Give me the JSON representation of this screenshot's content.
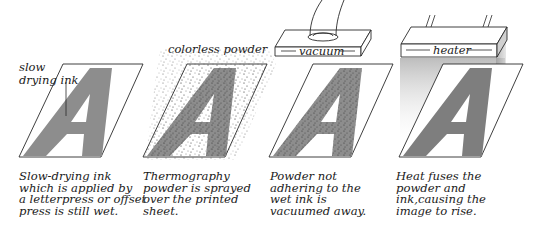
{
  "colors": {
    "ink": "#8d8d8d",
    "line": "#2a2a2a",
    "background": "#ffffff",
    "heat_glow": "#c8c8c8",
    "powder_dot": "#555555"
  },
  "panels": [
    {
      "step": 1,
      "label_lines": [
        "slow",
        "drying ink"
      ],
      "letter": "A",
      "caption_lines": [
        "Slow-drying ink",
        "which is applied by",
        "a letterpress or offset",
        "press is still wet."
      ]
    },
    {
      "step": 2,
      "label": "colorless powder",
      "letter": "A",
      "caption_lines": [
        "Thermography",
        "powder is sprayed",
        "over the printed",
        "sheet."
      ]
    },
    {
      "step": 3,
      "device_label": "vacuum",
      "device_icon": "vacuum-nozzle-icon",
      "letter": "A",
      "caption_lines": [
        "Powder not",
        "adhering to the",
        "wet ink is",
        "vacuumed away."
      ]
    },
    {
      "step": 4,
      "device_label": "heater",
      "device_icon": "heater-block-icon",
      "letter": "A",
      "caption_lines": [
        "Heat fuses the",
        "powder and",
        "ink,causing the",
        "image to rise."
      ]
    }
  ]
}
